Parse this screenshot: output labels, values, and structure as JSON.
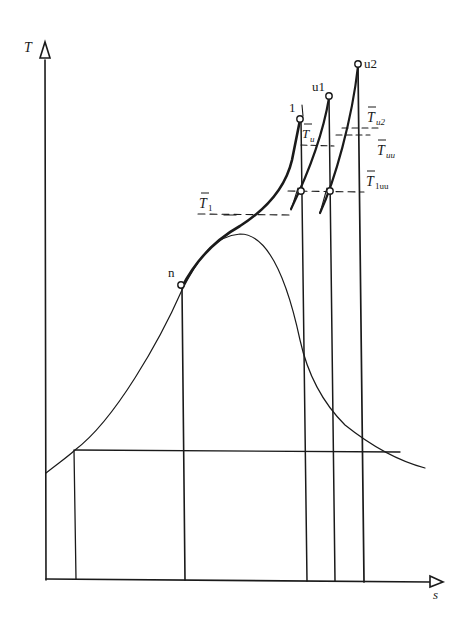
{
  "diagram": {
    "type": "T-s diagram",
    "axes": {
      "y_label": "T",
      "x_label": "s"
    },
    "points": {
      "n": "n",
      "p1": "1",
      "u1": "u1",
      "u2": "u2"
    },
    "temperature_labels": {
      "T1": "T",
      "T1_sub": "1",
      "Tu": "T",
      "Tu_sub": "u",
      "Tu2": "T",
      "Tu2_sub": "u2",
      "Tuu": "T",
      "Tuu_sub": "uu",
      "T1uu": "T",
      "T1uu_sub": "1uu"
    },
    "colors": {
      "ink": "#1a1a1a",
      "background": "#ffffff"
    }
  }
}
